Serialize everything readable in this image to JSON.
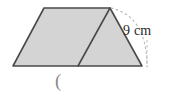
{
  "figure": {
    "kind": "geometry-diagram",
    "colors": {
      "shape_fill": "#d4d4d4",
      "shape_stroke": "#4a4a4a",
      "diagonal_stroke": "#4a4a4a",
      "dashed_stroke": "#b8b8b8",
      "label_text": "#2b2b2b",
      "stray_mark": "#8a8a8a",
      "background": "#ffffff"
    },
    "outline": {
      "name": "trapezoid",
      "points": "13,66 44,8 110,8 142,66",
      "vertices": [
        {
          "name": "bottom-left",
          "x": 13,
          "y": 66
        },
        {
          "name": "top-left",
          "x": 44,
          "y": 8
        },
        {
          "name": "top-right",
          "x": 110,
          "y": 8
        },
        {
          "name": "bottom-right",
          "x": 142,
          "y": 66
        }
      ]
    },
    "diagonal": {
      "name": "interior-diagonal",
      "x1": 110,
      "y1": 8,
      "x2": 78,
      "y2": 66
    },
    "dashed_arc": {
      "name": "slant-side-arc",
      "path": "M 111 8 Q 146 16 147 64",
      "dasharray": "2.5 2.5"
    },
    "dashed_tick": {
      "name": "arc-end-tick",
      "x1": 147,
      "y1": 40,
      "x2": 147,
      "y2": 70,
      "dasharray": "2.5 2.5"
    },
    "labels": {
      "measurement": "9 cm",
      "measurement_value": 9,
      "measurement_unit": "cm",
      "stray_mark": "("
    }
  }
}
